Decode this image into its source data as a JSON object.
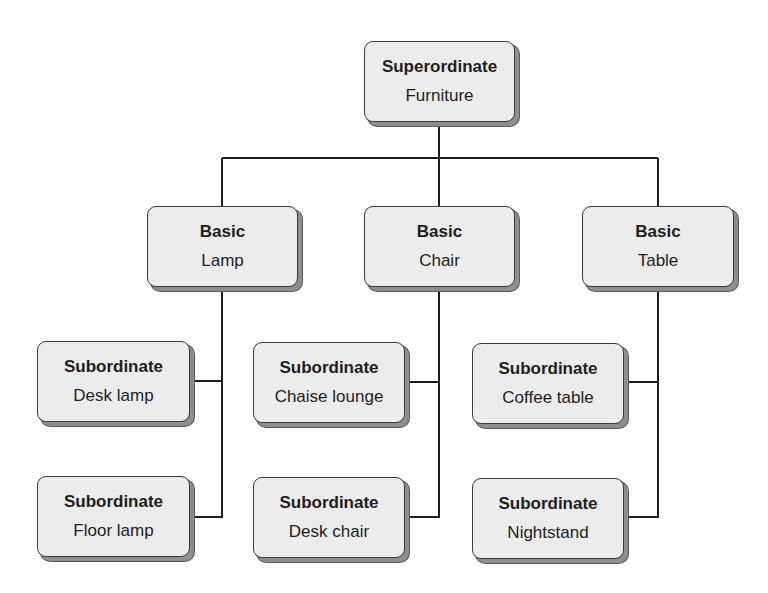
{
  "diagram": {
    "type": "hierarchy-tree",
    "colors": {
      "node_fill": "#ececec",
      "node_border": "#3a3a3a",
      "node_shadow": "#8e8e8e",
      "connector": "#1e1e1e",
      "text": "#1e1e1e"
    },
    "root": {
      "level": "Superordinate",
      "item": "Furniture"
    },
    "basic": [
      {
        "level": "Basic",
        "item": "Lamp",
        "subordinates": [
          {
            "level": "Subordinate",
            "item": "Desk lamp"
          },
          {
            "level": "Subordinate",
            "item": "Floor lamp"
          }
        ]
      },
      {
        "level": "Basic",
        "item": "Chair",
        "subordinates": [
          {
            "level": "Subordinate",
            "item": "Chaise lounge"
          },
          {
            "level": "Subordinate",
            "item": "Desk chair"
          }
        ]
      },
      {
        "level": "Basic",
        "item": "Table",
        "subordinates": [
          {
            "level": "Subordinate",
            "item": "Coffee table"
          },
          {
            "level": "Subordinate",
            "item": "Nightstand"
          }
        ]
      }
    ]
  }
}
